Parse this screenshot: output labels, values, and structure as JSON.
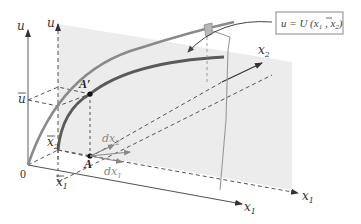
{
  "figure": {
    "colors": {
      "plane": "#ececec",
      "axis": "#555555",
      "dashed": "#555555",
      "curve_light": "#8a8a8a",
      "curve_dark": "#5a5a5a",
      "arrow_gray": "#888888",
      "box_border": "#888888"
    },
    "labels": {
      "u_axis_left": "u",
      "u_axis_right": "u",
      "u_bar": "u",
      "x2_bar": "x",
      "x2_bar_sub": "2",
      "x1_bar": "x",
      "x1_bar_sub": "1",
      "origin": "0",
      "x1_axis": "x",
      "x1_axis_sub": "1",
      "x1_axis_dashed": "x",
      "x1_axis_dashed_sub": "1",
      "x2_axis": "x",
      "x2_axis_sub": "2",
      "point_A": "A",
      "point_A_prime": "A′",
      "dx1": "dx",
      "dx1_sub": "1",
      "dx2": "dx",
      "dx2_sub": "2"
    },
    "callout": {
      "prefix": "u = U (x",
      "sub1": "1",
      "mid": " , x",
      "sub2": "2",
      "suffix": ")"
    }
  }
}
